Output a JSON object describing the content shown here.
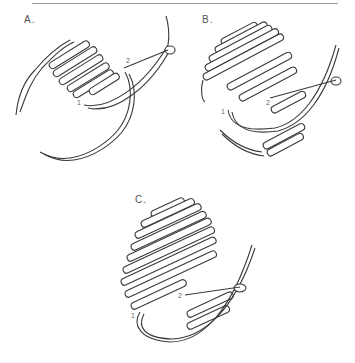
{
  "figure": {
    "panels": [
      {
        "id": "A",
        "label": "A.",
        "points": [
          "1",
          "2"
        ]
      },
      {
        "id": "B",
        "label": "B.",
        "points": [
          "1",
          "2"
        ]
      },
      {
        "id": "C",
        "label": "C.",
        "points": [
          "1",
          "2"
        ]
      }
    ]
  }
}
